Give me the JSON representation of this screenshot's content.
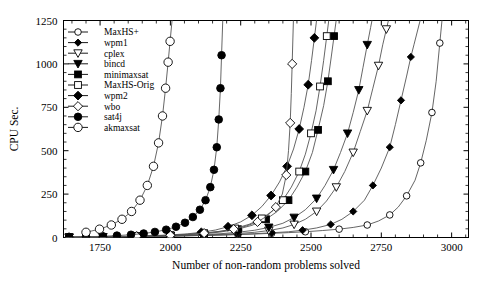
{
  "chart_data": {
    "type": "line",
    "title": "",
    "xlabel": "Number of non-random problems solved",
    "ylabel": "CPU Sec.",
    "xlim": [
      1620,
      3060
    ],
    "ylim": [
      0,
      1250
    ],
    "xticks": [
      1750,
      2000,
      2250,
      2500,
      2750,
      3000
    ],
    "xticklabels": [
      "1750",
      "2000",
      "2250",
      "2500",
      "2750",
      "3000"
    ],
    "yticks": [
      0,
      250,
      500,
      750,
      1000,
      1250
    ],
    "yticklabels": [
      "0",
      "250",
      "500",
      "750",
      "1000",
      "1250"
    ],
    "minor_ticks": true,
    "grid": false,
    "legend_position": "upper-left",
    "line_color": "#555555",
    "marker_fill_dark": "#000000",
    "marker_fill_light": "#ffffff",
    "series": [
      {
        "name": "MaxHS+",
        "marker": "circle-open",
        "filled": false,
        "x": [
          1640,
          1700,
          1760,
          1820,
          1880,
          1940,
          2000,
          2060,
          2120,
          2180,
          2240,
          2300,
          2360,
          2420,
          2480,
          2540,
          2600,
          2650,
          2700,
          2740,
          2780,
          2810,
          2840,
          2870,
          2890,
          2910,
          2930,
          2945,
          2958
        ],
        "y": [
          1,
          2,
          3,
          4,
          5,
          6,
          8,
          10,
          12,
          14,
          17,
          20,
          24,
          28,
          33,
          40,
          48,
          58,
          72,
          95,
          130,
          175,
          240,
          330,
          430,
          560,
          720,
          900,
          1120
        ]
      },
      {
        "name": "wpm1",
        "marker": "diamond-filled-small",
        "filled": true,
        "x": [
          1640,
          1700,
          1760,
          1820,
          1880,
          1940,
          2000,
          2060,
          2120,
          2180,
          2240,
          2300,
          2360,
          2420,
          2470,
          2520,
          2570,
          2610,
          2650,
          2690,
          2720,
          2750,
          2780,
          2800,
          2820,
          2840,
          2855,
          2866
        ],
        "y": [
          1,
          2,
          3,
          4,
          5,
          6,
          8,
          10,
          12,
          15,
          18,
          22,
          27,
          33,
          42,
          55,
          75,
          105,
          150,
          215,
          300,
          400,
          520,
          650,
          790,
          930,
          1040,
          1110
        ]
      },
      {
        "name": "cplex",
        "marker": "triangle-down-open",
        "filled": false,
        "x": [
          1640,
          1700,
          1760,
          1820,
          1880,
          1940,
          2000,
          2060,
          2120,
          2180,
          2240,
          2300,
          2350,
          2400,
          2440,
          2480,
          2520,
          2555,
          2590,
          2620,
          2650,
          2675,
          2700,
          2720,
          2740,
          2755,
          2768
        ],
        "y": [
          1,
          2,
          3,
          4,
          5,
          7,
          9,
          11,
          14,
          18,
          23,
          30,
          40,
          55,
          75,
          105,
          150,
          210,
          290,
          380,
          490,
          610,
          730,
          860,
          990,
          1110,
          1200
        ]
      },
      {
        "name": "bincd",
        "marker": "triangle-down-filled",
        "filled": true,
        "x": [
          1640,
          1700,
          1760,
          1820,
          1880,
          1940,
          2000,
          2060,
          2120,
          2180,
          2240,
          2300,
          2350,
          2400,
          2440,
          2480,
          2520,
          2550,
          2580,
          2605,
          2630,
          2650,
          2670,
          2685,
          2700,
          2712
        ],
        "y": [
          1,
          2,
          3,
          4,
          6,
          8,
          10,
          13,
          17,
          22,
          30,
          42,
          58,
          82,
          115,
          160,
          225,
          300,
          390,
          490,
          600,
          720,
          850,
          980,
          1110,
          1210
        ]
      },
      {
        "name": "minimaxsat",
        "marker": "square-filled",
        "filled": true,
        "x": [
          1640,
          1700,
          1760,
          1820,
          1880,
          1940,
          2000,
          2060,
          2120,
          2180,
          2240,
          2290,
          2340,
          2380,
          2420,
          2450,
          2480,
          2505,
          2525,
          2545,
          2560,
          2572,
          2582
        ],
        "y": [
          1,
          2,
          3,
          5,
          7,
          9,
          12,
          16,
          22,
          32,
          48,
          70,
          105,
          150,
          215,
          290,
          380,
          490,
          620,
          760,
          900,
          1040,
          1160
        ]
      },
      {
        "name": "MaxHS-Orig",
        "marker": "square-open",
        "filled": false,
        "x": [
          1640,
          1700,
          1760,
          1820,
          1880,
          1940,
          2000,
          2060,
          2120,
          2180,
          2230,
          2280,
          2325,
          2365,
          2400,
          2430,
          2458,
          2480,
          2500,
          2518,
          2532,
          2545,
          2556
        ],
        "y": [
          1,
          2,
          3,
          5,
          7,
          9,
          13,
          18,
          25,
          36,
          52,
          76,
          110,
          155,
          215,
          290,
          380,
          480,
          600,
          730,
          870,
          1020,
          1160
        ]
      },
      {
        "name": "wpm2",
        "marker": "diamond-filled",
        "filled": true,
        "x": [
          1640,
          1700,
          1760,
          1820,
          1880,
          1940,
          2000,
          2060,
          2110,
          2160,
          2205,
          2250,
          2290,
          2325,
          2358,
          2388,
          2415,
          2438,
          2458,
          2475,
          2490,
          2502,
          2512
        ],
        "y": [
          1,
          2,
          4,
          6,
          8,
          11,
          15,
          21,
          30,
          43,
          62,
          90,
          128,
          178,
          242,
          320,
          410,
          510,
          625,
          750,
          880,
          1020,
          1150
        ]
      },
      {
        "name": "wbo",
        "marker": "diamond-open",
        "filled": false,
        "x": [
          1640,
          1700,
          1760,
          1820,
          1880,
          1940,
          2000,
          2060,
          2120,
          2175,
          2225,
          2270,
          2310,
          2345,
          2375,
          2398,
          2412,
          2420,
          2426,
          2430,
          2433
        ],
        "y": [
          1,
          2,
          3,
          5,
          7,
          10,
          13,
          18,
          25,
          35,
          48,
          66,
          90,
          125,
          175,
          250,
          360,
          500,
          660,
          830,
          1000
        ]
      },
      {
        "name": "sat4j",
        "marker": "circle-filled",
        "filled": true,
        "x": [
          1640,
          1700,
          1760,
          1810,
          1860,
          1905,
          1945,
          1985,
          2020,
          2052,
          2080,
          2105,
          2125,
          2142,
          2155,
          2165,
          2172,
          2178,
          2182
        ],
        "y": [
          2,
          4,
          7,
          11,
          16,
          23,
          32,
          45,
          62,
          85,
          118,
          160,
          215,
          290,
          390,
          520,
          680,
          860,
          1050
        ]
      },
      {
        "name": "akmaxsat",
        "marker": "circle-open-large",
        "filled": false,
        "x": [
          1700,
          1748,
          1790,
          1828,
          1862,
          1892,
          1918,
          1940,
          1958,
          1972,
          1983,
          1992,
          1999
        ],
        "y": [
          30,
          48,
          72,
          105,
          150,
          215,
          300,
          410,
          545,
          700,
          860,
          1010,
          1130
        ]
      }
    ],
    "legend": [
      {
        "label": "MaxHS+",
        "marker": "circle-open"
      },
      {
        "label": "wpm1",
        "marker": "diamond-filled-small"
      },
      {
        "label": "cplex",
        "marker": "triangle-down-open"
      },
      {
        "label": "bincd",
        "marker": "triangle-down-filled"
      },
      {
        "label": "minimaxsat",
        "marker": "square-filled"
      },
      {
        "label": "MaxHS-Orig",
        "marker": "square-open"
      },
      {
        "label": "wpm2",
        "marker": "diamond-filled"
      },
      {
        "label": "wbo",
        "marker": "diamond-open"
      },
      {
        "label": "sat4j",
        "marker": "circle-filled"
      },
      {
        "label": "akmaxsat",
        "marker": "circle-open-large"
      }
    ]
  }
}
